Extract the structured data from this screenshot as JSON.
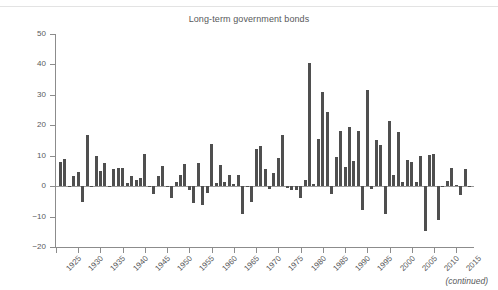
{
  "figure": {
    "title": "Long-term government bonds",
    "footnote": "(continued)",
    "bar_color": "#4f4f4f",
    "axis_color": "#8c8c8c",
    "text_color": "#58595b",
    "background": "#ffffff"
  },
  "chart_data": {
    "type": "bar",
    "title": "Long-term government bonds",
    "xlabel": "",
    "ylabel": "",
    "ylim": [
      -20,
      50
    ],
    "xlim": [
      1925,
      2019
    ],
    "grid": false,
    "legend": false,
    "y_ticks": [
      50,
      40,
      30,
      20,
      10,
      0,
      -10,
      -20
    ],
    "x_ticks": [
      1925,
      1930,
      1935,
      1940,
      1945,
      1950,
      1955,
      1960,
      1965,
      1970,
      1975,
      1980,
      1985,
      1990,
      1995,
      2000,
      2005,
      2010,
      2015
    ],
    "x_tick_rotation": -45,
    "categories": [
      1926,
      1927,
      1928,
      1929,
      1930,
      1931,
      1932,
      1933,
      1934,
      1935,
      1936,
      1937,
      1938,
      1939,
      1940,
      1941,
      1942,
      1943,
      1944,
      1945,
      1946,
      1947,
      1948,
      1949,
      1950,
      1951,
      1952,
      1953,
      1954,
      1955,
      1956,
      1957,
      1958,
      1959,
      1960,
      1961,
      1962,
      1963,
      1964,
      1965,
      1966,
      1967,
      1968,
      1969,
      1970,
      1971,
      1972,
      1973,
      1974,
      1975,
      1976,
      1977,
      1978,
      1979,
      1980,
      1981,
      1982,
      1983,
      1984,
      1985,
      1986,
      1987,
      1988,
      1989,
      1990,
      1991,
      1992,
      1993,
      1994,
      1995,
      1996,
      1997,
      1998,
      1999,
      2000,
      2001,
      2002,
      2003,
      2004,
      2005,
      2006,
      2007,
      2008,
      2009,
      2010,
      2011,
      2012,
      2013,
      2014,
      2015,
      2016,
      2017,
      2018
    ],
    "values": [
      7.8,
      8.9,
      0.1,
      3.4,
      4.7,
      -5.3,
      16.8,
      -0.1,
      10.0,
      5.0,
      7.5,
      0.2,
      5.5,
      5.9,
      6.1,
      0.9,
      3.2,
      2.1,
      2.8,
      10.7,
      -0.1,
      -2.6,
      3.4,
      6.5,
      0.1,
      -3.9,
      1.2,
      3.6,
      7.2,
      -1.3,
      -5.6,
      7.5,
      -6.1,
      -2.3,
      13.8,
      1.0,
      6.9,
      1.2,
      3.5,
      0.7,
      3.7,
      -9.2,
      -0.3,
      -5.1,
      12.1,
      13.2,
      5.7,
      -1.1,
      4.4,
      9.2,
      16.8,
      -0.7,
      -1.2,
      -1.2,
      -4.0,
      1.9,
      40.4,
      0.7,
      15.5,
      31.0,
      24.5,
      -2.7,
      9.7,
      18.1,
      6.2,
      19.3,
      8.1,
      18.2,
      -7.8,
      31.7,
      -0.9,
      15.1,
      13.5,
      -9.0,
      21.5,
      3.7,
      17.8,
      1.5,
      8.7,
      7.8,
      1.2,
      9.9,
      -14.9,
      10.1,
      10.7,
      -11.1,
      -0.4,
      1.8,
      6.0,
      0.5,
      -3.0,
      5.7,
      0.2
    ]
  }
}
